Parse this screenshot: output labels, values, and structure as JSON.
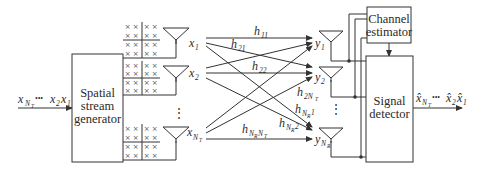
{
  "diagram": {
    "input_label": {
      "base": "x",
      "sub_first": "N",
      "subsub_first": "T",
      "dots": "•••",
      "mid": "x",
      "mid_sub": "2",
      "last": "x",
      "last_sub": "1"
    },
    "blocks": {
      "generator": {
        "line1": "Spatial",
        "line2": "stream",
        "line3": "generator"
      },
      "estimator": {
        "line1": "Channel",
        "line2": "estimator"
      },
      "detector": {
        "line1": "Signal",
        "line2": "detector"
      }
    },
    "tx": [
      {
        "label": "x",
        "sub": "1"
      },
      {
        "label": "x",
        "sub": "2"
      },
      {
        "label": "x",
        "sub": "N",
        "subsub": "T"
      }
    ],
    "rx": [
      {
        "label": "y",
        "sub": "1"
      },
      {
        "label": "y",
        "sub": "2"
      },
      {
        "label": "y",
        "sub": "N",
        "subsub": "R"
      }
    ],
    "channels": [
      {
        "h": "h",
        "sub": "11"
      },
      {
        "h": "h",
        "sub": "21"
      },
      {
        "h": "h",
        "sub": "22"
      },
      {
        "h": "h",
        "sub": "2N",
        "subsub": "T"
      },
      {
        "h": "h",
        "sub": "N",
        "subsub": "R",
        "tail": "1"
      },
      {
        "h": "h",
        "sub": "N",
        "subsub": "R",
        "tail": "2"
      },
      {
        "h": "h",
        "sub": "N",
        "subsub": "R",
        "mid2": "N",
        "subsub2": "T"
      }
    ],
    "vdots": "⋮",
    "output_label": {
      "base": "x̂",
      "sub_first": "N",
      "subsub_first": "T",
      "dots": "•••",
      "mid": "x̂",
      "mid_sub": "2",
      "last": "x̂",
      "last_sub": "1"
    },
    "grid_symbol": "×",
    "colors": {
      "line": "#333333",
      "text": "#2a2a2a",
      "background": "#ffffff"
    }
  }
}
